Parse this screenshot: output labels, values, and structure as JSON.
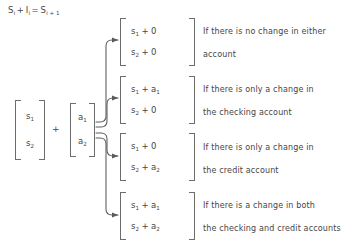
{
  "equation": {
    "lhs_state": "S",
    "lhs_state_sub": "i",
    "plus": "+",
    "lhs_input": "I",
    "lhs_input_sub": "i",
    "equals": "=",
    "rhs_state": "S",
    "rhs_state_sub": "i + 1"
  },
  "operands": {
    "plus_symbol": "+",
    "state_matrix": {
      "rows": [
        {
          "var": "s",
          "sub": "1"
        },
        {
          "var": "s",
          "sub": "2"
        }
      ]
    },
    "action_matrix": {
      "rows": [
        {
          "var": "a",
          "sub": "1"
        },
        {
          "var": "a",
          "sub": "2"
        }
      ]
    }
  },
  "branches": [
    {
      "name": "no-change",
      "matrix": {
        "rows": [
          {
            "left": "s",
            "left_sub": "1",
            "op": "+",
            "right": "0",
            "right_sub": ""
          },
          {
            "left": "s",
            "left_sub": "2",
            "op": "+",
            "right": "0",
            "right_sub": ""
          }
        ]
      },
      "description_line1": "If there is no change in either",
      "description_line2": "account"
    },
    {
      "name": "checking-only",
      "matrix": {
        "rows": [
          {
            "left": "s",
            "left_sub": "1",
            "op": "+",
            "right": "a",
            "right_sub": "1"
          },
          {
            "left": "s",
            "left_sub": "2",
            "op": "+",
            "right": "0",
            "right_sub": ""
          }
        ]
      },
      "description_line1": "If there is only a change in",
      "description_line2": "the checking account"
    },
    {
      "name": "credit-only",
      "matrix": {
        "rows": [
          {
            "left": "s",
            "left_sub": "1",
            "op": "+",
            "right": "0",
            "right_sub": ""
          },
          {
            "left": "s",
            "left_sub": "2",
            "op": "+",
            "right": "a",
            "right_sub": "2"
          }
        ]
      },
      "description_line1": "If there is only a change in",
      "description_line2": "the credit account"
    },
    {
      "name": "both-accounts",
      "matrix": {
        "rows": [
          {
            "left": "s",
            "left_sub": "1",
            "op": "+",
            "right": "a",
            "right_sub": "1"
          },
          {
            "left": "s",
            "left_sub": "2",
            "op": "+",
            "right": "a",
            "right_sub": "2"
          }
        ]
      },
      "description_line1": "If there is a change in both",
      "description_line2": "the checking and credit accounts"
    }
  ],
  "colors": {
    "text": "#454545",
    "bracket": "#6d6d6d",
    "wire": "#5a5a5a",
    "background": "#ffffff"
  }
}
